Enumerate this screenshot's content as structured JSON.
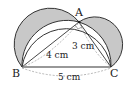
{
  "diagram": {
    "type": "geometry",
    "vertices": {
      "A": {
        "label": "A"
      },
      "B": {
        "label": "B"
      },
      "C": {
        "label": "C"
      }
    },
    "lengths": {
      "AB": "4 cm",
      "AC": "3 cm",
      "BC": "5 cm"
    },
    "colors": {
      "shade": "#c8c8c8",
      "stroke": "#333333",
      "dashed": "#888888"
    }
  }
}
